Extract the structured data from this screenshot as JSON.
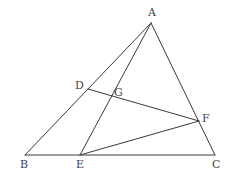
{
  "diagram": {
    "type": "geometry",
    "points": [
      {
        "id": "A",
        "x": 151,
        "y": 23,
        "label": "A",
        "lx": 148,
        "ly": 16
      },
      {
        "id": "B",
        "x": 25,
        "y": 155,
        "label": "B",
        "lx": 20,
        "ly": 168
      },
      {
        "id": "C",
        "x": 215,
        "y": 155,
        "label": "C",
        "lx": 212,
        "ly": 168
      },
      {
        "id": "D",
        "x": 88,
        "y": 89,
        "label": "D",
        "lx": 75,
        "ly": 89
      },
      {
        "id": "E",
        "x": 80,
        "y": 155,
        "label": "E",
        "lx": 76,
        "ly": 168
      },
      {
        "id": "F",
        "x": 199,
        "y": 121,
        "label": "F",
        "lx": 202,
        "ly": 122
      },
      {
        "id": "G",
        "x": 111,
        "y": 96,
        "label": "G",
        "lx": 114,
        "ly": 96
      }
    ],
    "segments": [
      [
        "A",
        "B"
      ],
      [
        "B",
        "C"
      ],
      [
        "C",
        "A"
      ],
      [
        "A",
        "E"
      ],
      [
        "D",
        "F"
      ],
      [
        "E",
        "F"
      ]
    ],
    "line_color": "#3a3a3a",
    "label_color": "#444444"
  }
}
